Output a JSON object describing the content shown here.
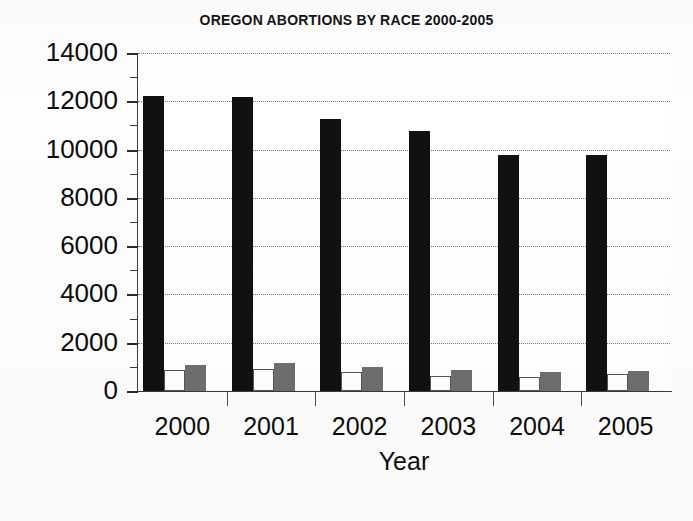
{
  "chart_data": {
    "type": "bar",
    "title": "OREGON ABORTIONS BY RACE 2000-2005",
    "xlabel": "Year",
    "ylabel": "",
    "categories": [
      "2000",
      "2001",
      "2002",
      "2003",
      "2004",
      "2005"
    ],
    "ylim": [
      0,
      14000
    ],
    "y_ticks": [
      0,
      2000,
      4000,
      6000,
      8000,
      10000,
      12000,
      14000
    ],
    "y_tick_labels": [
      "0",
      "2000",
      "4000",
      "6000",
      "8000",
      "10000",
      "12000",
      "14000"
    ],
    "y_minor_ticks": [
      1000,
      3000,
      5000,
      7000,
      9000,
      11000,
      13000
    ],
    "grid": "horizontal-dotted",
    "legend": "none",
    "series": [
      {
        "name": "White",
        "color": "#111111",
        "values": [
          12200,
          12180,
          11250,
          10790,
          9760,
          9770
        ]
      },
      {
        "name": "Black",
        "color": "#ffffff",
        "values": [
          880,
          900,
          780,
          640,
          580,
          700
        ]
      },
      {
        "name": "Other",
        "color": "#6e6e6e",
        "values": [
          1080,
          1150,
          1010,
          880,
          790,
          830
        ]
      }
    ]
  },
  "axes": {
    "x_title": "Year"
  }
}
